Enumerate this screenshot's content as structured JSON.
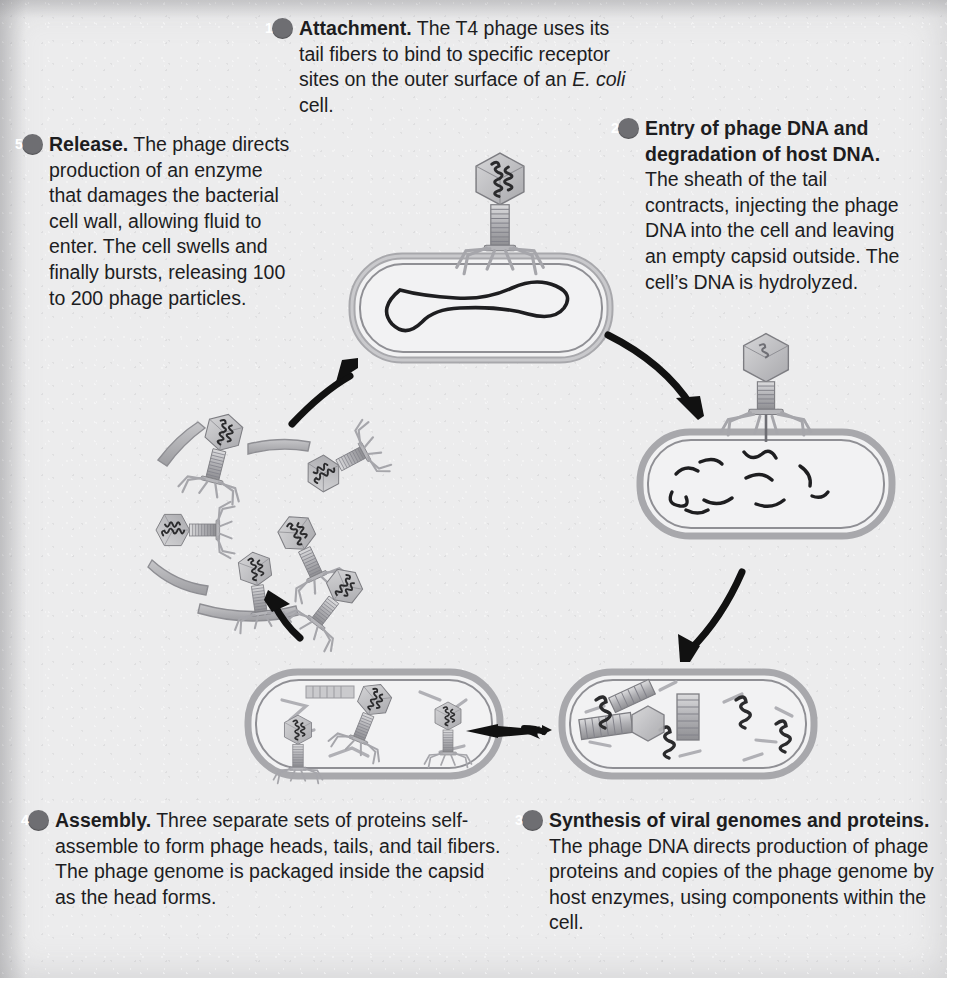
{
  "figure": {
    "background_color": "#ececed",
    "badge_color": "#6e6e72",
    "arrow_color": "#111111",
    "ink_color": "#1d1d1f"
  },
  "steps": [
    {
      "number": "1",
      "title": "Attachment.",
      "body_before_italic": " The T4 phage uses its tail fibers to bind to specific receptor sites on the outer surface of an ",
      "italic": "E. coli",
      "body_after_italic": " cell."
    },
    {
      "number": "2",
      "title": "Entry of phage DNA and degradation of host DNA.",
      "body": " The sheath of the tail contracts, injecting the phage DNA into the cell and leaving an empty capsid outside. The cell’s DNA is hydrolyzed."
    },
    {
      "number": "3",
      "title": "Synthesis of viral genomes and proteins.",
      "body": " The phage DNA directs production of phage proteins and copies of the phage genome by host enzymes, using components within the cell."
    },
    {
      "number": "4",
      "title": "Assembly.",
      "body": " Three separate sets of proteins self-assemble to form phage heads, tails, and tail fibers. The phage genome is packaged inside the capsid as the head forms."
    },
    {
      "number": "5",
      "title": "Release.",
      "body": " The phage directs production of an enzyme that damages the bacterial cell wall, allowing fluid to enter. The cell swells and finally bursts, releasing 100 to 200 phage particles."
    }
  ],
  "illustrations": [
    {
      "name": "phage-attached-to-cell",
      "caption_step": "1",
      "contents": "T4 phage with hexagonal capsid containing DNA, striated tail sheath and tail fibers, sitting atop a rod-shaped bacterium whose circular chromosome is visible inside"
    },
    {
      "name": "cell-with-injected-dna",
      "caption_step": "2",
      "contents": "Bacterium with empty phage capsid attached on top, sheath contracted, host DNA hydrolyzed into short fragments"
    },
    {
      "name": "cell-with-phage-parts",
      "caption_step": "3",
      "contents": "Bacterium filled with newly synthesized phage capsids, tail tubes, DNA coils and tail fiber rods"
    },
    {
      "name": "cell-with-assembled-phages",
      "caption_step": "4",
      "contents": "Bacterium containing three fully assembled phage particles plus loose tails and fibers"
    },
    {
      "name": "released-phage-cluster",
      "caption_step": "5",
      "contents": "Burst cell wall fragments with roughly six released phage particles scattered outward"
    }
  ],
  "arrows": [
    {
      "name": "arrow-step1-to-step2",
      "direction": "down-right"
    },
    {
      "name": "arrow-step2-to-step3",
      "direction": "down-left"
    },
    {
      "name": "arrow-step3-to-step4",
      "direction": "left"
    },
    {
      "name": "arrow-step4-to-step5",
      "direction": "up-left"
    },
    {
      "name": "arrow-step5-to-step1",
      "direction": "up-right"
    }
  ]
}
